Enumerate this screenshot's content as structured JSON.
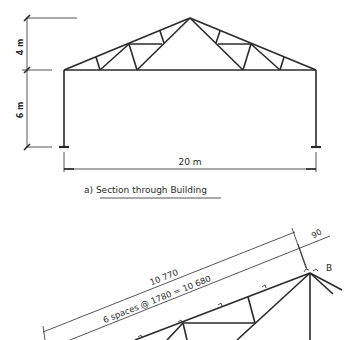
{
  "section_a": {
    "dim_top_height": "4 m",
    "dim_bottom_height": "6 m",
    "span": "20 m",
    "caption": "a)  Section through  Building"
  },
  "detail": {
    "overall_length": "10 770",
    "spacing": "6  spaces  @  1780  =  10  680",
    "offset": "90",
    "node_label": "B"
  },
  "colors": {
    "line": "#2a2a2a",
    "background": "#ffffff"
  }
}
